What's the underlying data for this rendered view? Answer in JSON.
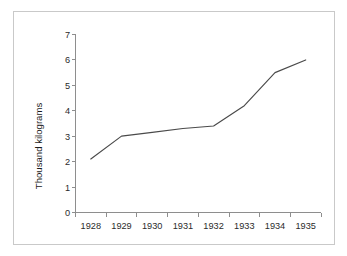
{
  "figure": {
    "background_color": "#ffffff",
    "border_color": "#c9c9c9",
    "axis_color": "#8e8e8e",
    "line_color": "#4a4a4a",
    "text_color": "#2b2b2b"
  },
  "chart_data": {
    "type": "line",
    "title": "",
    "subtitle": "",
    "xlabel": "",
    "ylabel": "Thousand kilograms",
    "categories": [
      "1928",
      "1929",
      "1930",
      "1931",
      "1932",
      "1933",
      "1934",
      "1935"
    ],
    "x": [
      1928,
      1929,
      1930,
      1931,
      1932,
      1933,
      1934,
      1935
    ],
    "values": [
      2.1,
      3.0,
      3.15,
      3.3,
      3.4,
      4.2,
      5.5,
      6.0
    ],
    "series": [
      {
        "name": "Thousand kilograms",
        "values": [
          2.1,
          3.0,
          3.15,
          3.3,
          3.4,
          4.2,
          5.5,
          6.0
        ]
      }
    ],
    "ylim": [
      0,
      7
    ],
    "ytick_labels": [
      "0",
      "1",
      "2",
      "3",
      "4",
      "5",
      "6",
      "7"
    ],
    "ytick_values": [
      0,
      1,
      2,
      3,
      4,
      5,
      6,
      7
    ],
    "xtick_labels": [
      "1928",
      "1929",
      "1930",
      "1931",
      "1932",
      "1933",
      "1934",
      "1935"
    ],
    "grid": false,
    "legend": false,
    "legend_position": "none",
    "markers": false,
    "annotations": []
  },
  "y_axis": {
    "title": "Thousand kilograms",
    "labels": {
      "t0": "0",
      "t1": "1",
      "t2": "2",
      "t3": "3",
      "t4": "4",
      "t5": "5",
      "t6": "6",
      "t7": "7"
    }
  },
  "x_axis": {
    "labels": {
      "c0": "1928",
      "c1": "1929",
      "c2": "1930",
      "c3": "1931",
      "c4": "1932",
      "c5": "1933",
      "c6": "1934",
      "c7": "1935"
    }
  }
}
